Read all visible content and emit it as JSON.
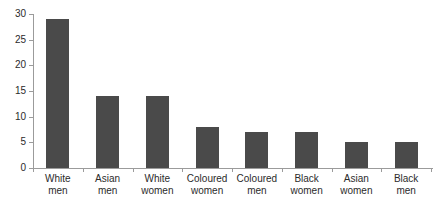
{
  "chart_data": {
    "type": "bar",
    "title": "",
    "subtitle": "",
    "xlabel": "",
    "ylabel": "",
    "ylim": [
      0,
      30
    ],
    "yticks": [
      0,
      5,
      10,
      15,
      20,
      25,
      30
    ],
    "ytick_labels": [
      "0",
      "5",
      "10",
      "15",
      "20",
      "25",
      "30"
    ],
    "grid": false,
    "legend": false,
    "legend_position": "none",
    "orientation": "vertical",
    "categories": [
      "White men",
      "Asian men",
      "White women",
      "Coloured women",
      "Coloured men",
      "Black women",
      "Asian women",
      "Black men"
    ],
    "category_lines": [
      [
        "White",
        "men"
      ],
      [
        "Asian",
        "men"
      ],
      [
        "White",
        "women"
      ],
      [
        "Coloured",
        "women"
      ],
      [
        "Coloured",
        "men"
      ],
      [
        "Black",
        "women"
      ],
      [
        "Asian",
        "women"
      ],
      [
        "Black",
        "men"
      ]
    ],
    "values": [
      29,
      14,
      14,
      8,
      7,
      7,
      5,
      5
    ],
    "bar_color": "#4a4a4a",
    "axis_color": "#9b9b9b",
    "text_color": "#2b2b2b",
    "background_color": "#ffffff"
  }
}
